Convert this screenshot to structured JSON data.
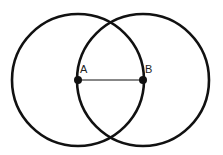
{
  "diagram": {
    "points": [
      {
        "label": "A",
        "x": 78,
        "y": 80
      },
      {
        "label": "B",
        "x": 143,
        "y": 80
      }
    ],
    "circles": [
      {
        "name": "circle-centered-A",
        "cx": 78,
        "cy": 80,
        "r": 66
      },
      {
        "name": "circle-centered-B",
        "cx": 143,
        "cy": 80,
        "r": 66
      }
    ],
    "segment": {
      "from": "A",
      "to": "B"
    },
    "stroke_color": "#111111"
  }
}
